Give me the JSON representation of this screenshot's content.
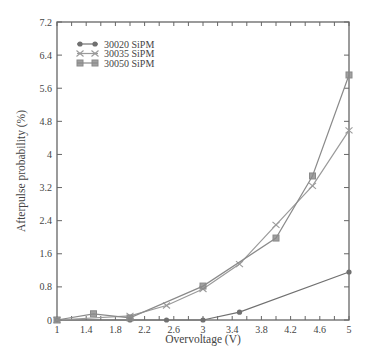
{
  "chart_data": {
    "type": "line",
    "title": "",
    "xlabel": "Overvoltage (V)",
    "ylabel": "Afterpulse probability (%)",
    "xlim": [
      1,
      5
    ],
    "ylim": [
      0,
      7.2
    ],
    "x_ticks": [
      1,
      1.4,
      1.8,
      2.2,
      2.6,
      3,
      3.4,
      3.8,
      4.2,
      4.6,
      5
    ],
    "x_tick_labels": [
      "1",
      "1.4",
      "1.8",
      "2.2",
      "2.6",
      "3",
      "3.4",
      "3.8",
      "4.2",
      "4.6",
      "5"
    ],
    "y_ticks": [
      0,
      0.8,
      1.6,
      2.4,
      3.2,
      4,
      4.8,
      5.6,
      6.4,
      7.2
    ],
    "y_tick_labels": [
      "0",
      "0.8",
      "1.6",
      "2.4",
      "3.2",
      "4",
      "4.8",
      "5.6",
      "6.4",
      "7.2"
    ],
    "grid": false,
    "legend_position": "upper left",
    "series": [
      {
        "name": "30020 SiPM",
        "marker": "circle",
        "color": "#707070",
        "x": [
          1,
          2,
          2.5,
          3,
          3.5,
          5
        ],
        "values": [
          0,
          0,
          0,
          0,
          0.19,
          1.16
        ]
      },
      {
        "name": "30035 SiPM",
        "marker": "x",
        "color": "#9a9a9a",
        "x": [
          1,
          2,
          2.5,
          3,
          3.5,
          4,
          4.5,
          5
        ],
        "values": [
          0,
          0.1,
          0.35,
          0.75,
          1.35,
          2.3,
          3.24,
          4.58
        ]
      },
      {
        "name": "30050 SiPM",
        "marker": "square",
        "color": "#8a8a8a",
        "x": [
          1,
          1.5,
          2,
          3,
          4,
          4.5,
          5
        ],
        "values": [
          0,
          0.15,
          0.05,
          0.82,
          1.98,
          3.48,
          5.92
        ]
      }
    ]
  }
}
